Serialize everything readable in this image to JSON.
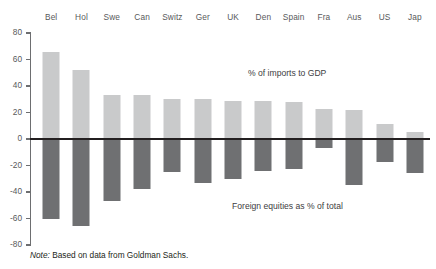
{
  "chart_data": {
    "type": "bar",
    "title": "",
    "xlabel": "",
    "ylabel": "",
    "ylim": [
      -80,
      80
    ],
    "grid": false,
    "legend_position": "inline-annotation",
    "categories": [
      "Bel",
      "Hol",
      "Swe",
      "Can",
      "Switz",
      "Ger",
      "UK",
      "Den",
      "Spain",
      "Fra",
      "Aus",
      "US",
      "Jap"
    ],
    "y_ticks": [
      80,
      60,
      40,
      20,
      0,
      -20,
      -40,
      -60,
      -80
    ],
    "y_tick_labels": [
      "80",
      "60",
      "40",
      "20",
      "0",
      "-20",
      "-40",
      "-60",
      "-80"
    ],
    "series": [
      {
        "name": "% of imports to GDP",
        "color": "#c9cacb",
        "values": [
          66,
          52,
          33,
          33,
          30,
          30,
          29,
          29,
          28,
          23,
          22,
          11,
          5
        ]
      },
      {
        "name": "Foreign equities as % of total",
        "color": "#6f7072",
        "values": [
          -60,
          -66,
          -47,
          -38,
          -25,
          -33,
          -30,
          -24,
          -23,
          -7,
          -35,
          -17,
          -26
        ]
      }
    ],
    "annotations": [
      {
        "text": "% of imports to GDP",
        "series": "% of imports to GDP"
      },
      {
        "text": "Foreign equities as % of total",
        "series": "Foreign equities as % of total"
      }
    ],
    "note_lead": "Note:",
    "note_text": " Based on data from Goldman Sachs."
  },
  "colors": {
    "positive_bar": "#c9cacb",
    "negative_bar": "#6f7072",
    "axis": "#231f20",
    "text": "#58595b",
    "background": "#ffffff"
  }
}
